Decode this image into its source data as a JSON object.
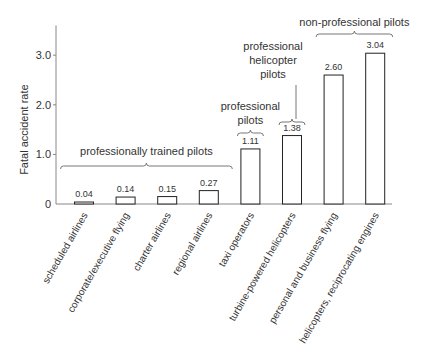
{
  "chart_data": {
    "type": "bar",
    "title": "",
    "xlabel": "",
    "ylabel": "Fatal accident rate",
    "ylim": [
      0,
      3.5
    ],
    "yticks": [
      {
        "value": 0,
        "label": "0"
      },
      {
        "value": 1,
        "label": "1.0"
      },
      {
        "value": 2,
        "label": "2.0"
      },
      {
        "value": 3,
        "label": "3.0"
      }
    ],
    "grid": false,
    "categories": [
      "scheduled airlines",
      "corporate/executive flying",
      "charter airlines",
      "regional airlines",
      "taxi operators",
      "turbine-powered helicopters",
      "personal and business flying",
      "helicopters, reciprocating engines"
    ],
    "values": [
      0.04,
      0.14,
      0.15,
      0.27,
      1.11,
      1.38,
      2.6,
      3.04
    ],
    "value_labels": [
      "0.04",
      "0.14",
      "0.15",
      "0.27",
      "1.11",
      "1.38",
      "2.60",
      "3.04"
    ],
    "groups": [
      {
        "label": [
          "professionally trained pilots"
        ],
        "from": 0,
        "to": 3
      },
      {
        "label": [
          "professional",
          "pilots"
        ],
        "from": 4,
        "to": 4
      },
      {
        "label": [
          "professional",
          "helicopter",
          "pilots"
        ],
        "from": 5,
        "to": 5
      },
      {
        "label": [
          "non-professional pilots"
        ],
        "from": 6,
        "to": 7
      }
    ]
  }
}
